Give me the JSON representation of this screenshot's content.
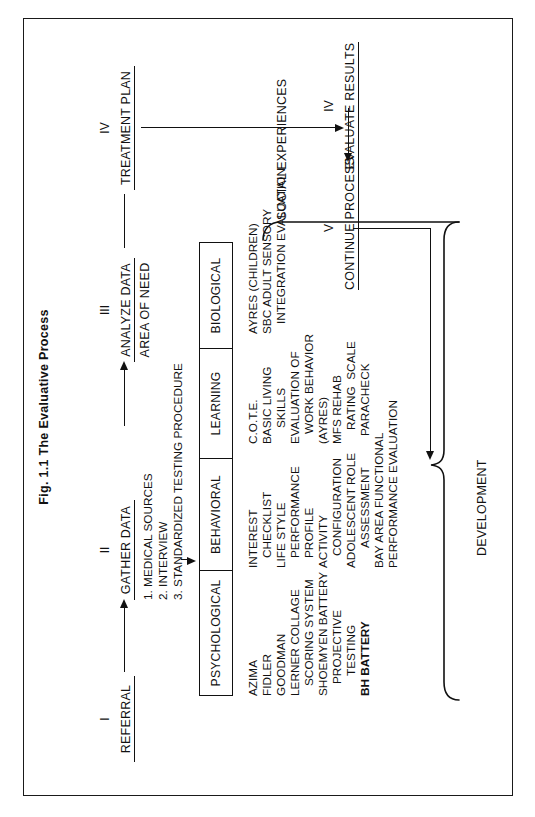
{
  "figure": {
    "title": "Fig. 1.1 The Evaluative Process"
  },
  "steps": [
    {
      "numeral": "I",
      "label": "REFERRAL"
    },
    {
      "numeral": "II",
      "label": "GATHER DATA"
    },
    {
      "numeral": "III",
      "label": "ANALYZE DATA",
      "sublabel": "AREA OF NEED"
    },
    {
      "numeral": "IV",
      "label": "TREATMENT PLAN"
    },
    {
      "numeral": "IV",
      "label": "EVALUATE RESULTS"
    },
    {
      "numeral": "V",
      "label": "CONTINUE PROCESS"
    }
  ],
  "gather_data_items": [
    "1. MEDICAL SOURCES",
    "2. INTERVIEW",
    "3. STANDARDIZED TESTING PROCEDURE"
  ],
  "columns": [
    {
      "header": "PSYCHOLOGICAL",
      "items": [
        "AZIMA",
        "FIDLER",
        "GOODMAN",
        "LERNER COLLAGE",
        "SCORING SYSTEM",
        "SHOEMYEN BATTERY",
        "PROJECTIVE",
        "TESTING",
        "BH BATTERY"
      ]
    },
    {
      "header": "BEHAVIORAL",
      "items": [
        "INTEREST",
        "CHECKLIST",
        "LIFE STYLE",
        "PERFORMANCE",
        "PROFILE",
        "ACTIVITY",
        "CONFIGURATION",
        "ADOLESCENT ROLE",
        "ASSESSMENT",
        "BAY AREA FUNCTIONAL",
        "PERFORMANCE EVALUATION"
      ]
    },
    {
      "header": "LEARNING",
      "items": [
        "C.O.T.E.",
        "BASIC LIVING",
        "SKILLS",
        "EVALUATION OF",
        "WORK BEHAVIOR",
        "(AYRES)",
        "MFS REHAB",
        "RATING  SCALE",
        "PARACHECK"
      ]
    },
    {
      "header": "BIOLOGICAL",
      "items": [
        "AYRES (CHILDREN)",
        "SBC ADULT SENSORY",
        "INTEGRATION EVALUATION"
      ]
    }
  ],
  "annotations": {
    "development": "DEVELOPMENT",
    "social_experiences": "SOCIAL EXPERIENCES"
  },
  "colors": {
    "ink": "#111111",
    "paper": "#ffffff"
  }
}
